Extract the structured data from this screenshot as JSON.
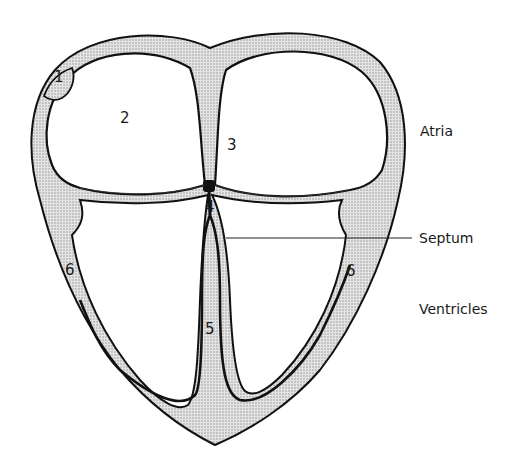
{
  "diagram": {
    "type": "heart-cross-section",
    "colors": {
      "line": "#111111",
      "tissue_fill": "#d6d6d6",
      "chamber_fill": "#ffffff",
      "background": "#ffffff"
    },
    "numbers": [
      {
        "id": "1",
        "text": "1"
      },
      {
        "id": "2",
        "text": "2"
      },
      {
        "id": "3",
        "text": "3"
      },
      {
        "id": "4",
        "text": "4"
      },
      {
        "id": "5",
        "text": "5"
      },
      {
        "id": "6a",
        "text": "6"
      },
      {
        "id": "6b",
        "text": "6"
      }
    ],
    "labels": {
      "atria": "Atria",
      "septum": "Septum",
      "ventricles": "Ventricles"
    }
  }
}
